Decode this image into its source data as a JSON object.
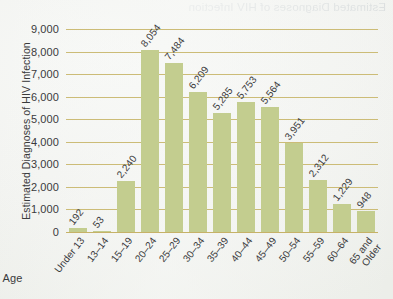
{
  "paper": {
    "bleed_through_text": "Estimated Diagnoses of HIV Infection"
  },
  "chart_data": {
    "type": "bar",
    "title": "",
    "xlabel": "Age",
    "ylabel": "Estimated Diagnoses of HIV Infection",
    "ylim": [
      0,
      9000
    ],
    "ytick_labels": [
      "9,000",
      "8,000",
      "7,000",
      "6,000",
      "5,000",
      "4,000",
      "3,000",
      "2,000",
      "1,000",
      "0"
    ],
    "ytick_values": [
      9000,
      8000,
      7000,
      6000,
      5000,
      4000,
      3000,
      2000,
      1000,
      0
    ],
    "grid": true,
    "legend": false,
    "bar_color": "#c3cd8f",
    "gridline_color": "#c9b870",
    "text_color": "#3a3a3c",
    "categories": [
      "Under 13",
      "13–14",
      "15–19",
      "20–24",
      "25–29",
      "30–34",
      "35–39",
      "40–44",
      "45–49",
      "50–54",
      "55–59",
      "60–64",
      "65 and Older"
    ],
    "values": [
      192,
      53,
      2240,
      8054,
      7484,
      6209,
      5285,
      5753,
      5564,
      3951,
      2312,
      1229,
      948
    ],
    "value_labels": [
      "192",
      "53",
      "2,240",
      "8,054",
      "7,484",
      "6,209",
      "5,285",
      "5,753",
      "5,564",
      "3,951",
      "2,312",
      "1,229",
      "948"
    ]
  }
}
